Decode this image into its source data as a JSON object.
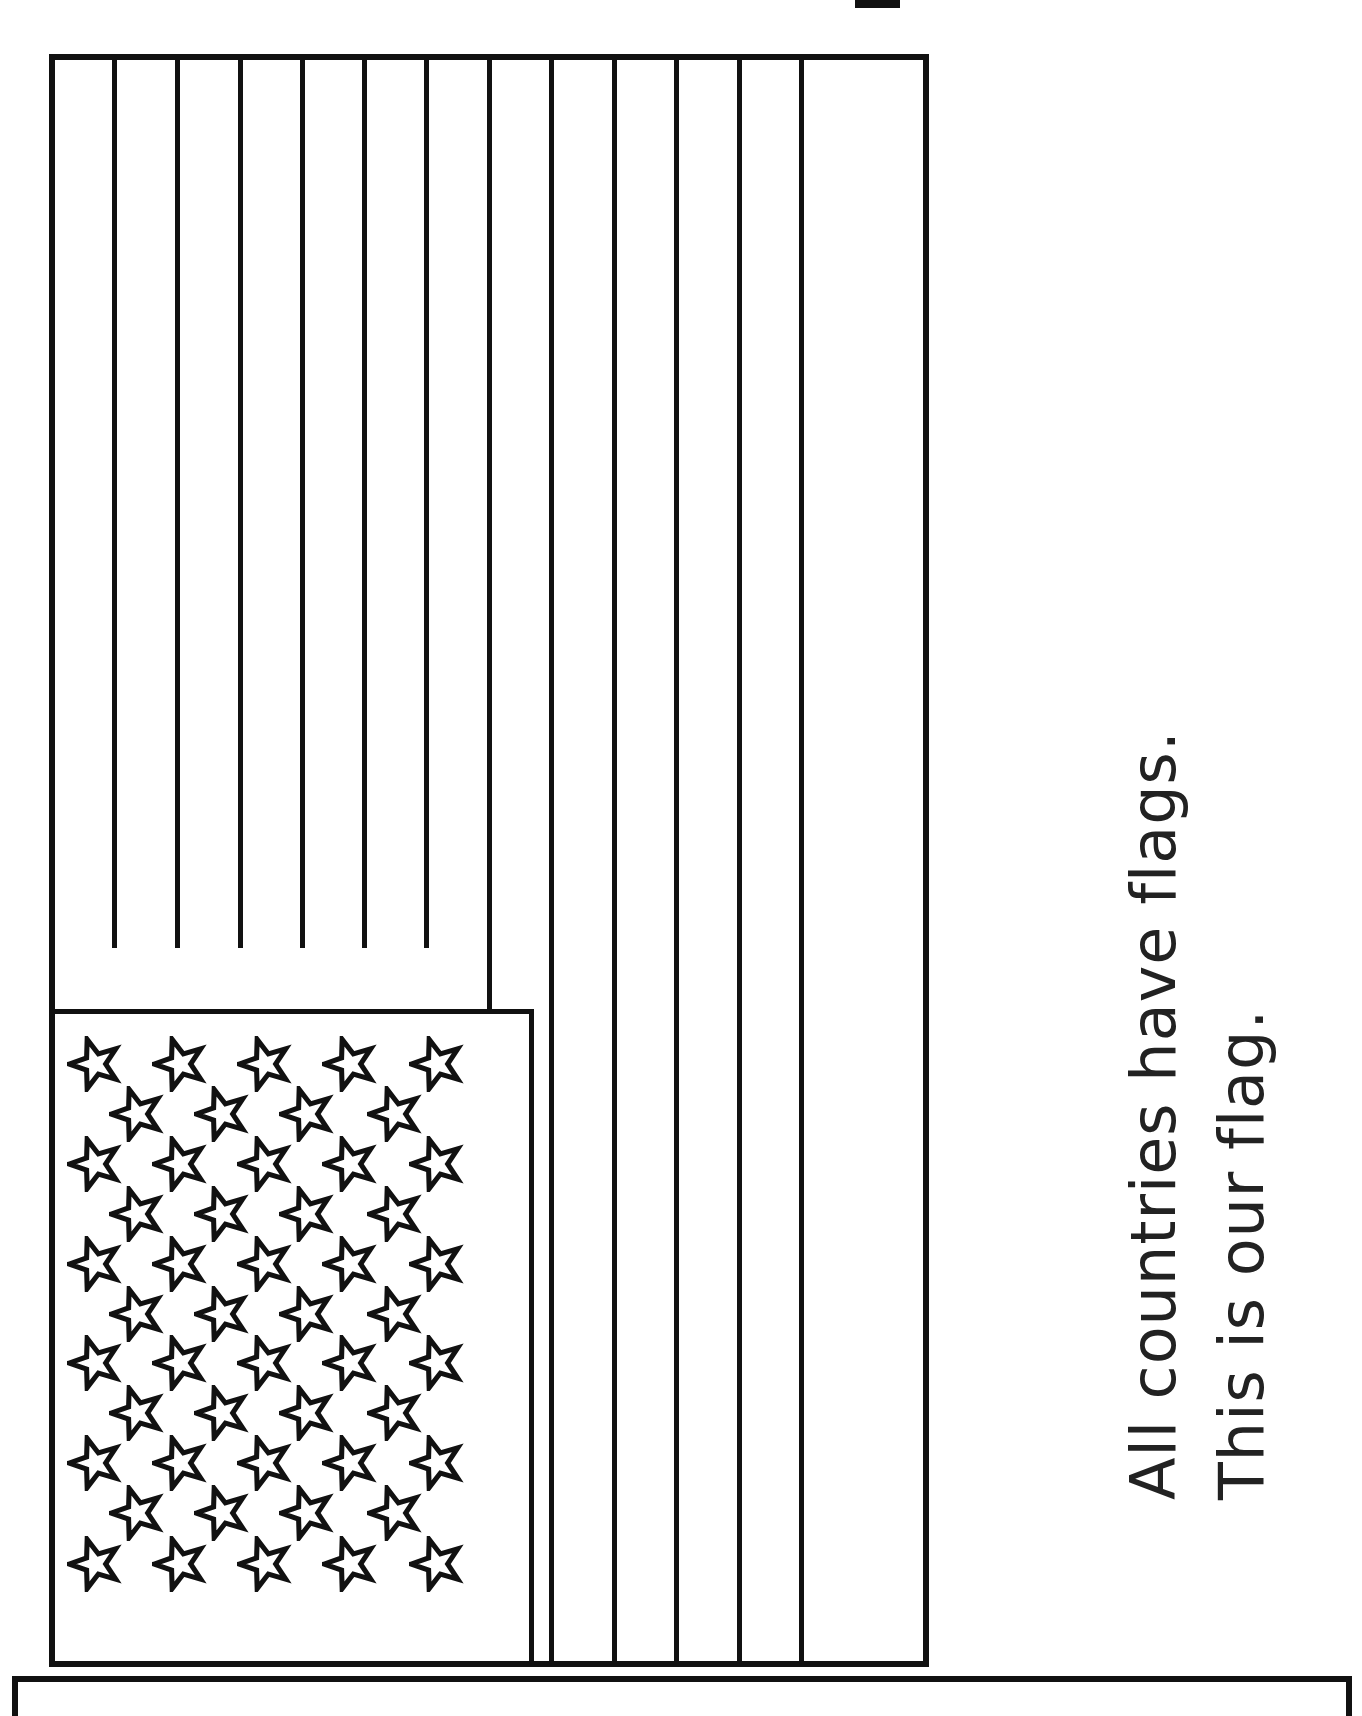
{
  "worksheet": {
    "caption_lines": [
      "All countries have flags.",
      "This is our flag."
    ]
  },
  "flag": {
    "stripe_count": 13,
    "star_count": 50,
    "colors": {
      "ink": "#111111",
      "paper": "#ffffff"
    }
  }
}
